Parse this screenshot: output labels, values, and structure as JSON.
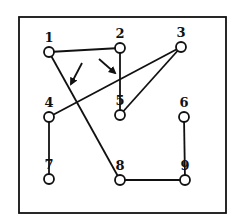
{
  "diagram": {
    "type": "graph",
    "frame": {
      "x": 19,
      "y": 17,
      "width": 207,
      "height": 196
    },
    "nodes": [
      {
        "id": "1",
        "label": "1",
        "x": 49,
        "y": 52
      },
      {
        "id": "2",
        "label": "2",
        "x": 120,
        "y": 48
      },
      {
        "id": "3",
        "label": "3",
        "x": 181,
        "y": 47
      },
      {
        "id": "4",
        "label": "4",
        "x": 49,
        "y": 117
      },
      {
        "id": "5",
        "label": "5",
        "x": 120,
        "y": 115
      },
      {
        "id": "6",
        "label": "6",
        "x": 184,
        "y": 117
      },
      {
        "id": "7",
        "label": "7",
        "x": 49,
        "y": 179
      },
      {
        "id": "8",
        "label": "8",
        "x": 120,
        "y": 180
      },
      {
        "id": "9",
        "label": "9",
        "x": 185,
        "y": 180
      }
    ],
    "edges": [
      {
        "from": "1",
        "to": "2"
      },
      {
        "from": "2",
        "to": "5"
      },
      {
        "from": "1",
        "to": "8"
      },
      {
        "from": "4",
        "to": "3"
      },
      {
        "from": "3",
        "to": "5"
      },
      {
        "from": "4",
        "to": "7"
      },
      {
        "from": "8",
        "to": "9"
      },
      {
        "from": "9",
        "to": "6"
      }
    ],
    "arrows": [
      {
        "name": "crossing-arrow-left",
        "x1": 82,
        "y1": 63,
        "x2": 71,
        "y2": 84
      },
      {
        "name": "crossing-arrow-right",
        "x1": 99,
        "y1": 59,
        "x2": 115,
        "y2": 73
      }
    ]
  }
}
